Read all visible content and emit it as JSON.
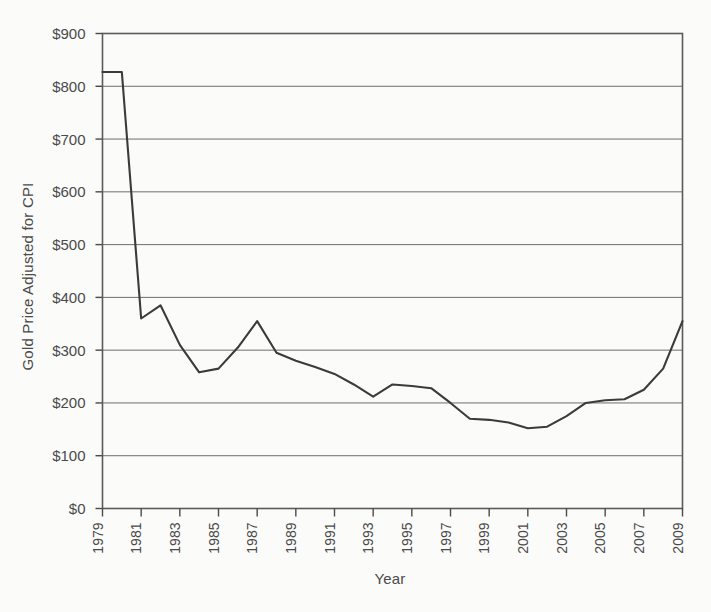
{
  "chart_data": {
    "type": "line",
    "title": "",
    "xlabel": "Year",
    "ylabel": "Gold Price Adjusted for CPI",
    "xlim": [
      1979,
      2009
    ],
    "ylim": [
      0,
      900
    ],
    "grid": true,
    "legend": false,
    "y_tick_labels": [
      "$900",
      "$800",
      "$700",
      "$600",
      "$500",
      "$400",
      "$300",
      "$200",
      "$100",
      "$0"
    ],
    "y_tick_values": [
      900,
      800,
      700,
      600,
      500,
      400,
      300,
      200,
      100,
      0
    ],
    "x_tick_labels": [
      "1979",
      "1981",
      "1983",
      "1985",
      "1987",
      "1989",
      "1991",
      "1993",
      "1995",
      "1997",
      "1999",
      "2001",
      "2003",
      "2005",
      "2007",
      "2009"
    ],
    "x_tick_values": [
      1979,
      1981,
      1983,
      1985,
      1987,
      1989,
      1991,
      1993,
      1995,
      1997,
      1999,
      2001,
      2003,
      2005,
      2007,
      2009
    ],
    "x": [
      1979,
      1980,
      1981,
      1982,
      1983,
      1984,
      1985,
      1986,
      1987,
      1988,
      1989,
      1990,
      1991,
      1992,
      1993,
      1994,
      1995,
      1996,
      1997,
      1998,
      1999,
      2000,
      2001,
      2002,
      2003,
      2004,
      2005,
      2006,
      2007,
      2008,
      2009
    ],
    "values": [
      827,
      827,
      360,
      385,
      310,
      258,
      265,
      305,
      355,
      295,
      280,
      268,
      255,
      235,
      212,
      235,
      232,
      228,
      200,
      170,
      168,
      163,
      152,
      155,
      175,
      200,
      205,
      207,
      225,
      265,
      355
    ],
    "series": [
      {
        "name": "Gold Price Adjusted for CPI",
        "values": [
          827,
          827,
          360,
          385,
          310,
          258,
          265,
          305,
          355,
          295,
          280,
          268,
          255,
          235,
          212,
          235,
          232,
          228,
          200,
          170,
          168,
          163,
          152,
          155,
          175,
          200,
          205,
          207,
          225,
          265,
          355
        ]
      }
    ],
    "line_color": "#3b3b3b",
    "grid_color": "#6e6e6e",
    "background_color": "#fbfbfa"
  }
}
